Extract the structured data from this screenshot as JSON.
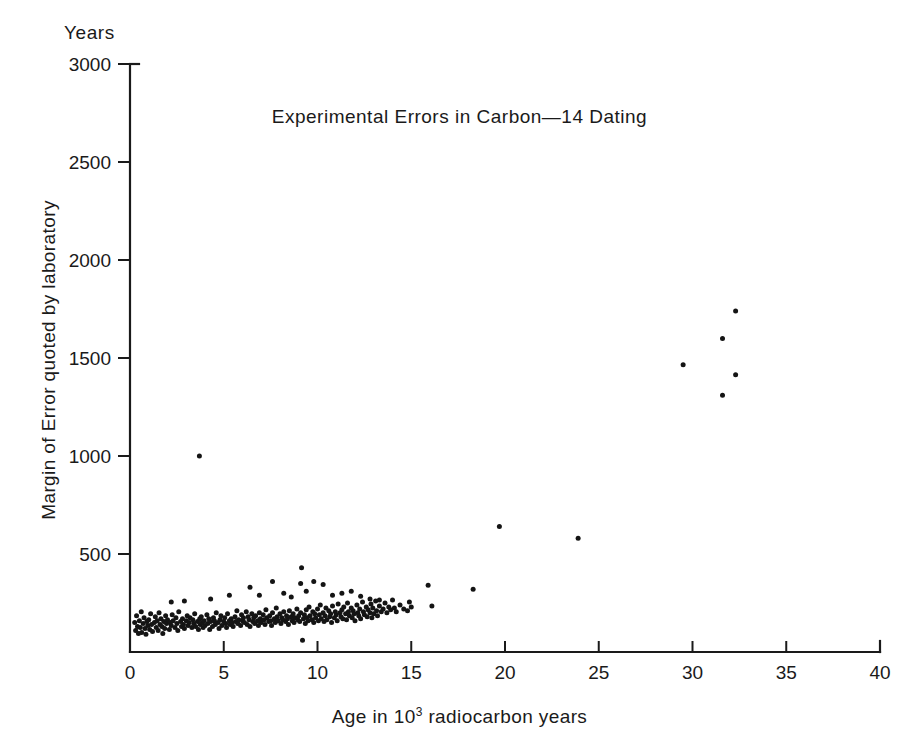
{
  "figure": {
    "units_label": "Years",
    "title": "Experimental Errors in Carbon—14   Dating",
    "xlabel_prefix": "Age in 10",
    "xlabel_exponent": "3",
    "xlabel_suffix": " radiocarbon years",
    "ylabel": "Margin of Error quoted by laboratory",
    "marker_color": "#141414",
    "axis_color": "#1a1a1a"
  },
  "chart_data": {
    "type": "scatter",
    "title": "Experimental Errors in Carbon—14   Dating",
    "xlabel": "Age in 10^3 radiocarbon years",
    "ylabel": "Margin of Error quoted by laboratory",
    "units": "Years",
    "xlim": [
      0,
      40
    ],
    "ylim": [
      0,
      3000
    ],
    "xticks": [
      0,
      5,
      10,
      15,
      20,
      25,
      30,
      35,
      40
    ],
    "xticklabels": [
      "0",
      "5",
      "10",
      "15",
      "20",
      "25",
      "30",
      "35",
      "40"
    ],
    "yticks": [
      500,
      1000,
      1500,
      2000,
      2500,
      3000
    ],
    "yticklabels": [
      "500",
      "1000",
      "1500",
      "2000",
      "2500",
      "3000"
    ],
    "grid": false,
    "legend": null,
    "marker": "filled-circle",
    "marker_size_px": 5,
    "points": [
      [
        0.25,
        150
      ],
      [
        0.3,
        110
      ],
      [
        0.35,
        185
      ],
      [
        0.4,
        130
      ],
      [
        0.45,
        95
      ],
      [
        0.5,
        160
      ],
      [
        0.55,
        125
      ],
      [
        0.6,
        205
      ],
      [
        0.62,
        100
      ],
      [
        0.7,
        145
      ],
      [
        0.75,
        175
      ],
      [
        0.8,
        120
      ],
      [
        0.85,
        90
      ],
      [
        0.9,
        155
      ],
      [
        0.95,
        135
      ],
      [
        1.0,
        165
      ],
      [
        1.05,
        115
      ],
      [
        1.1,
        195
      ],
      [
        1.15,
        140
      ],
      [
        1.2,
        105
      ],
      [
        1.3,
        150
      ],
      [
        1.35,
        180
      ],
      [
        1.4,
        125
      ],
      [
        1.45,
        160
      ],
      [
        1.5,
        110
      ],
      [
        1.55,
        200
      ],
      [
        1.6,
        140
      ],
      [
        1.65,
        170
      ],
      [
        1.7,
        130
      ],
      [
        1.75,
        95
      ],
      [
        1.8,
        155
      ],
      [
        1.85,
        120
      ],
      [
        1.9,
        185
      ],
      [
        1.95,
        145
      ],
      [
        2.0,
        165
      ],
      [
        2.1,
        115
      ],
      [
        2.15,
        150
      ],
      [
        2.2,
        135
      ],
      [
        2.25,
        190
      ],
      [
        2.3,
        160
      ],
      [
        2.4,
        125
      ],
      [
        2.45,
        175
      ],
      [
        2.5,
        145
      ],
      [
        2.55,
        110
      ],
      [
        2.6,
        205
      ],
      [
        2.7,
        155
      ],
      [
        2.75,
        130
      ],
      [
        2.8,
        170
      ],
      [
        2.85,
        140
      ],
      [
        2.9,
        120
      ],
      [
        3.0,
        160
      ],
      [
        3.05,
        185
      ],
      [
        3.1,
        135
      ],
      [
        3.15,
        150
      ],
      [
        3.2,
        175
      ],
      [
        3.3,
        125
      ],
      [
        3.35,
        165
      ],
      [
        3.4,
        145
      ],
      [
        3.45,
        195
      ],
      [
        3.5,
        130
      ],
      [
        3.6,
        155
      ],
      [
        3.65,
        115
      ],
      [
        3.7,
        1000
      ],
      [
        3.72,
        170
      ],
      [
        3.75,
        140
      ],
      [
        3.8,
        180
      ],
      [
        3.85,
        150
      ],
      [
        3.9,
        125
      ],
      [
        3.95,
        160
      ],
      [
        4.0,
        135
      ],
      [
        4.1,
        190
      ],
      [
        4.15,
        145
      ],
      [
        4.2,
        170
      ],
      [
        4.25,
        115
      ],
      [
        4.3,
        155
      ],
      [
        4.4,
        130
      ],
      [
        4.45,
        175
      ],
      [
        4.5,
        160
      ],
      [
        4.55,
        140
      ],
      [
        4.6,
        200
      ],
      [
        4.7,
        150
      ],
      [
        4.75,
        120
      ],
      [
        4.8,
        165
      ],
      [
        4.85,
        185
      ],
      [
        4.9,
        135
      ],
      [
        5.0,
        155
      ],
      [
        5.05,
        175
      ],
      [
        5.1,
        145
      ],
      [
        5.15,
        125
      ],
      [
        5.2,
        195
      ],
      [
        5.3,
        160
      ],
      [
        5.35,
        140
      ],
      [
        5.4,
        170
      ],
      [
        5.45,
        150
      ],
      [
        5.5,
        130
      ],
      [
        5.6,
        180
      ],
      [
        5.65,
        155
      ],
      [
        5.7,
        210
      ],
      [
        5.75,
        145
      ],
      [
        5.8,
        165
      ],
      [
        5.9,
        135
      ],
      [
        5.95,
        190
      ],
      [
        6.0,
        160
      ],
      [
        6.05,
        175
      ],
      [
        6.1,
        150
      ],
      [
        6.2,
        205
      ],
      [
        6.25,
        140
      ],
      [
        6.3,
        180
      ],
      [
        6.35,
        165
      ],
      [
        6.4,
        130
      ],
      [
        6.5,
        195
      ],
      [
        6.55,
        155
      ],
      [
        6.6,
        175
      ],
      [
        6.65,
        145
      ],
      [
        6.7,
        185
      ],
      [
        6.8,
        160
      ],
      [
        6.85,
        135
      ],
      [
        6.9,
        200
      ],
      [
        6.95,
        170
      ],
      [
        7.0,
        150
      ],
      [
        7.1,
        190
      ],
      [
        7.15,
        165
      ],
      [
        7.2,
        140
      ],
      [
        7.25,
        215
      ],
      [
        7.3,
        175
      ],
      [
        7.4,
        155
      ],
      [
        7.45,
        185
      ],
      [
        7.5,
        160
      ],
      [
        7.55,
        135
      ],
      [
        7.6,
        200
      ],
      [
        7.7,
        170
      ],
      [
        7.75,
        150
      ],
      [
        7.8,
        225
      ],
      [
        7.85,
        180
      ],
      [
        7.9,
        160
      ],
      [
        8.0,
        195
      ],
      [
        8.05,
        145
      ],
      [
        8.1,
        175
      ],
      [
        8.15,
        165
      ],
      [
        8.2,
        205
      ],
      [
        8.3,
        155
      ],
      [
        8.35,
        185
      ],
      [
        8.4,
        170
      ],
      [
        8.45,
        140
      ],
      [
        8.5,
        210
      ],
      [
        8.6,
        180
      ],
      [
        8.65,
        160
      ],
      [
        8.7,
        195
      ],
      [
        8.75,
        150
      ],
      [
        8.8,
        175
      ],
      [
        8.9,
        220
      ],
      [
        8.95,
        165
      ],
      [
        9.0,
        185
      ],
      [
        9.05,
        155
      ],
      [
        9.1,
        200
      ],
      [
        9.15,
        430
      ],
      [
        9.2,
        60
      ],
      [
        9.25,
        170
      ],
      [
        9.3,
        190
      ],
      [
        9.35,
        145
      ],
      [
        9.4,
        215
      ],
      [
        9.45,
        175
      ],
      [
        9.5,
        160
      ],
      [
        9.55,
        230
      ],
      [
        9.6,
        185
      ],
      [
        9.7,
        165
      ],
      [
        9.75,
        205
      ],
      [
        9.8,
        150
      ],
      [
        9.85,
        195
      ],
      [
        9.9,
        175
      ],
      [
        10.0,
        220
      ],
      [
        10.05,
        160
      ],
      [
        10.1,
        190
      ],
      [
        10.15,
        240
      ],
      [
        10.2,
        170
      ],
      [
        10.3,
        200
      ],
      [
        10.35,
        155
      ],
      [
        10.4,
        185
      ],
      [
        10.45,
        225
      ],
      [
        10.5,
        165
      ],
      [
        10.6,
        210
      ],
      [
        10.65,
        180
      ],
      [
        10.7,
        195
      ],
      [
        10.75,
        150
      ],
      [
        10.8,
        235
      ],
      [
        10.9,
        175
      ],
      [
        10.95,
        205
      ],
      [
        11.0,
        190
      ],
      [
        11.05,
        160
      ],
      [
        11.1,
        245
      ],
      [
        11.2,
        200
      ],
      [
        11.25,
        180
      ],
      [
        11.3,
        215
      ],
      [
        11.35,
        170
      ],
      [
        11.4,
        230
      ],
      [
        11.5,
        195
      ],
      [
        11.55,
        165
      ],
      [
        11.6,
        250
      ],
      [
        11.65,
        205
      ],
      [
        11.7,
        185
      ],
      [
        11.8,
        225
      ],
      [
        11.85,
        175
      ],
      [
        11.9,
        210
      ],
      [
        11.95,
        195
      ],
      [
        12.0,
        160
      ],
      [
        12.1,
        240
      ],
      [
        12.15,
        200
      ],
      [
        12.2,
        185
      ],
      [
        12.25,
        220
      ],
      [
        12.3,
        170
      ],
      [
        12.4,
        255
      ],
      [
        12.45,
        205
      ],
      [
        12.5,
        190
      ],
      [
        12.6,
        230
      ],
      [
        12.65,
        180
      ],
      [
        12.7,
        215
      ],
      [
        12.8,
        200
      ],
      [
        12.85,
        245
      ],
      [
        12.9,
        175
      ],
      [
        12.95,
        225
      ],
      [
        13.0,
        195
      ],
      [
        13.1,
        260
      ],
      [
        13.15,
        210
      ],
      [
        13.2,
        185
      ],
      [
        13.3,
        235
      ],
      [
        13.4,
        205
      ],
      [
        13.5,
        220
      ],
      [
        13.6,
        250
      ],
      [
        13.7,
        200
      ],
      [
        13.8,
        230
      ],
      [
        13.9,
        215
      ],
      [
        14.0,
        265
      ],
      [
        14.1,
        225
      ],
      [
        14.2,
        205
      ],
      [
        14.4,
        240
      ],
      [
        14.6,
        220
      ],
      [
        14.8,
        210
      ],
      [
        14.9,
        255
      ],
      [
        15.0,
        230
      ],
      [
        2.2,
        255
      ],
      [
        2.9,
        260
      ],
      [
        4.3,
        270
      ],
      [
        5.3,
        290
      ],
      [
        6.4,
        330
      ],
      [
        6.9,
        290
      ],
      [
        7.6,
        360
      ],
      [
        8.2,
        300
      ],
      [
        8.6,
        280
      ],
      [
        9.1,
        350
      ],
      [
        9.4,
        310
      ],
      [
        9.8,
        360
      ],
      [
        10.3,
        345
      ],
      [
        10.8,
        290
      ],
      [
        11.3,
        300
      ],
      [
        11.8,
        310
      ],
      [
        12.3,
        285
      ],
      [
        12.8,
        270
      ],
      [
        13.3,
        265
      ],
      [
        15.9,
        340
      ],
      [
        16.1,
        235
      ],
      [
        18.3,
        320
      ],
      [
        19.7,
        640
      ],
      [
        23.9,
        580
      ],
      [
        29.5,
        1465
      ],
      [
        31.6,
        1600
      ],
      [
        31.6,
        1310
      ],
      [
        32.3,
        1740
      ],
      [
        32.3,
        1415
      ]
    ]
  }
}
